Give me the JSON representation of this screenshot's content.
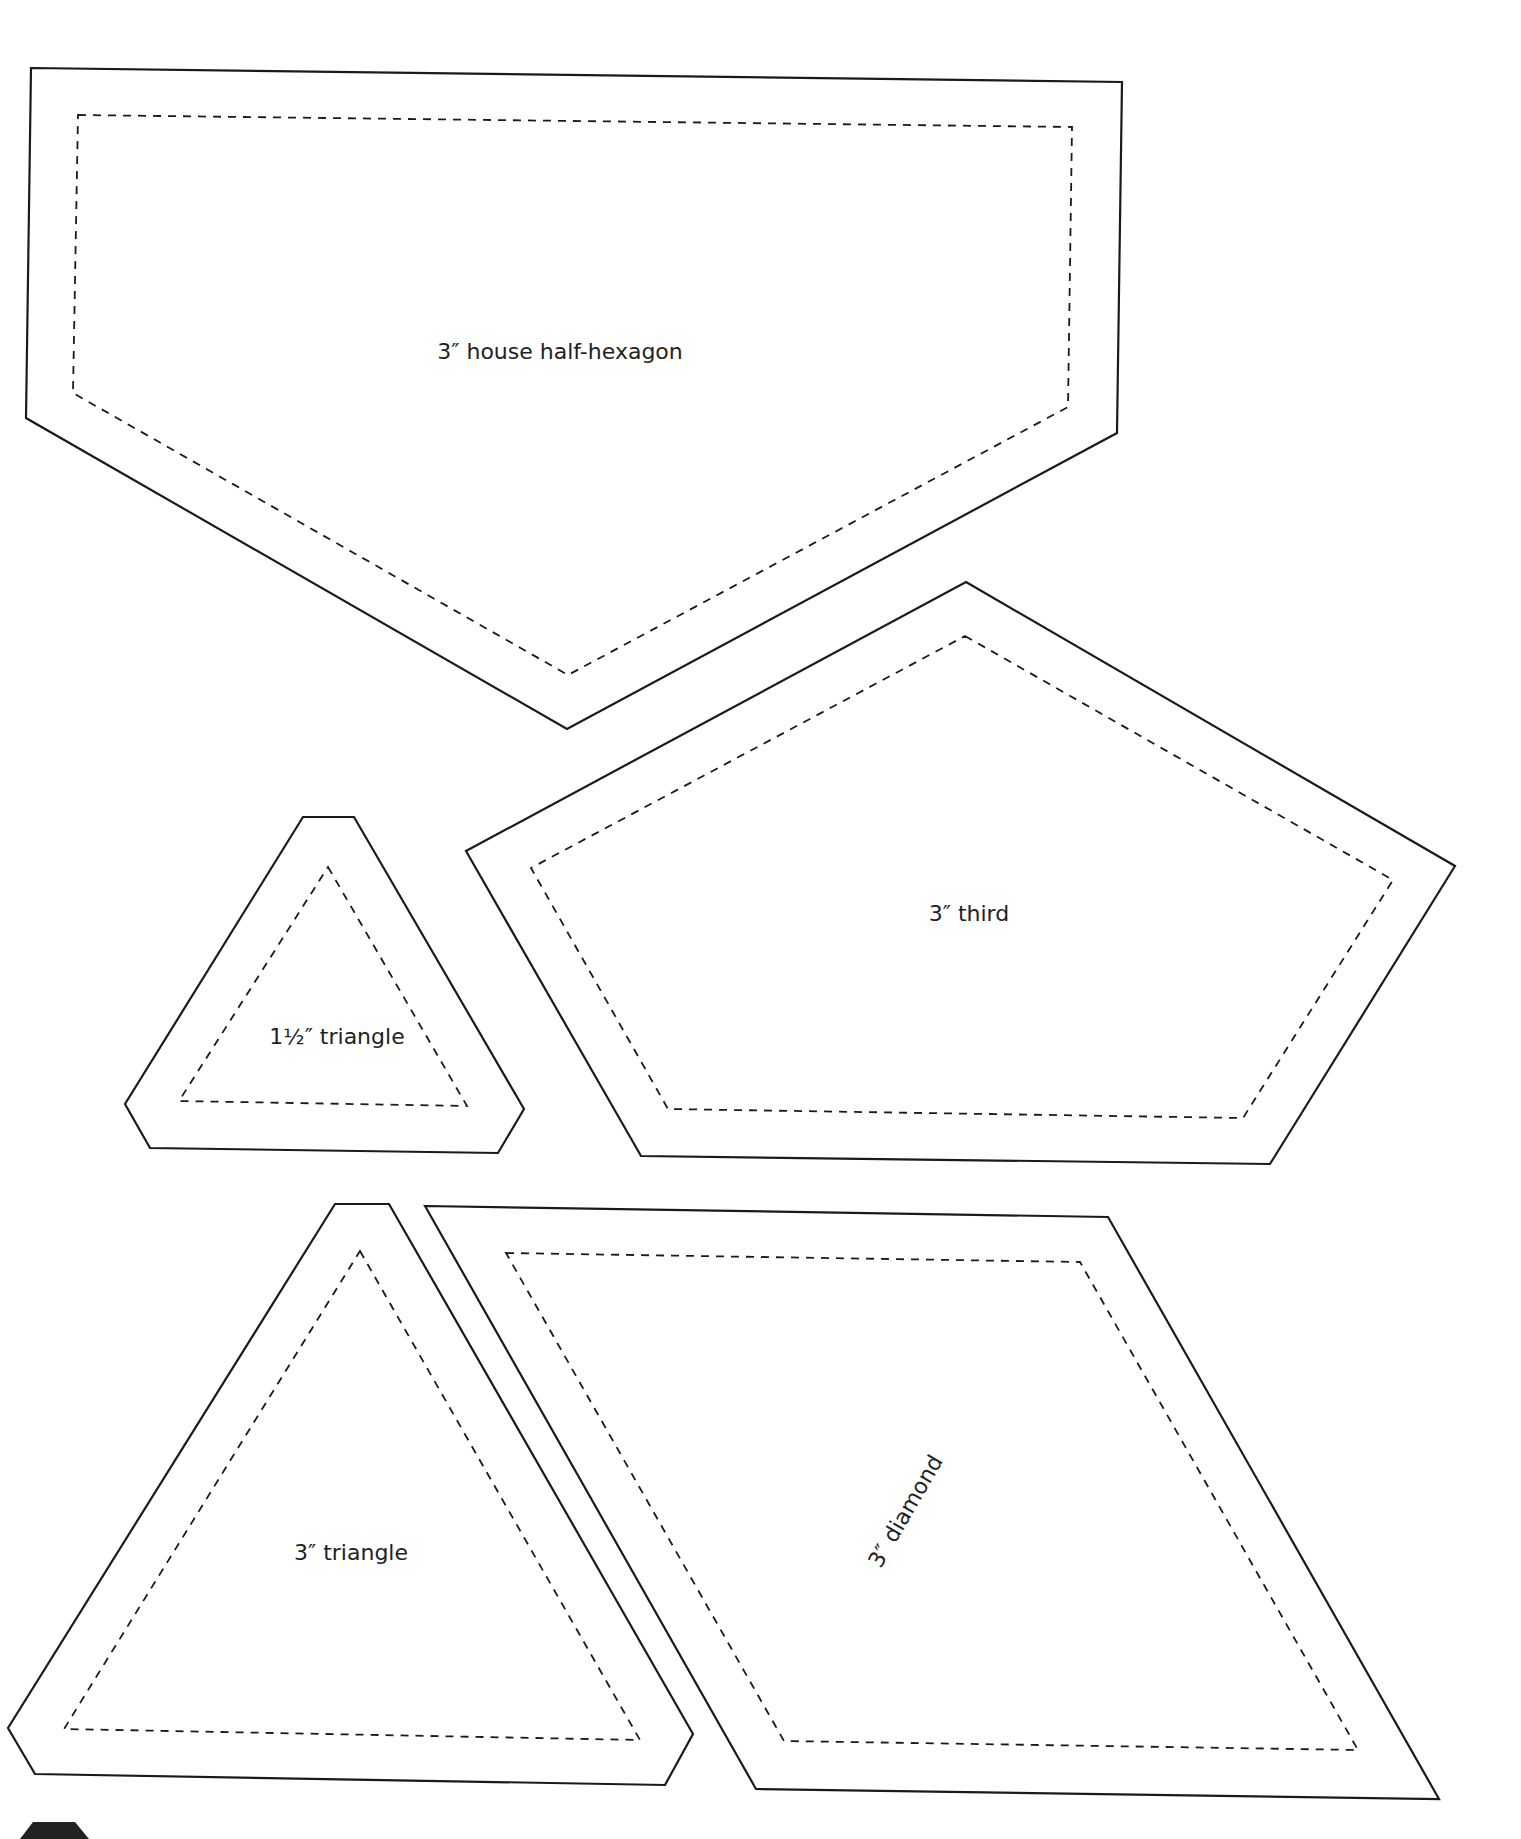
{
  "page": {
    "background": "#ffffff",
    "line_color": "#1a1a1a"
  },
  "templates": [
    {
      "id": "house-half-hexagon",
      "label": "3″ house half-hexagon"
    },
    {
      "id": "third",
      "label": "3″ third"
    },
    {
      "id": "small-triangle",
      "label": "1½″ triangle"
    },
    {
      "id": "triangle",
      "label": "3″ triangle"
    },
    {
      "id": "diamond",
      "label": "3″ diamond"
    }
  ],
  "corner_mark": {
    "shape": "dark-hexagon-tab",
    "color": "#222222"
  }
}
